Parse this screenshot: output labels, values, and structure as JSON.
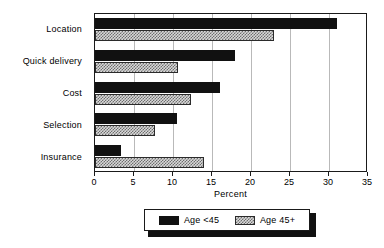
{
  "chart_data": {
    "type": "bar",
    "orientation": "horizontal",
    "title": "",
    "categories": [
      "Location",
      "Quick delivery",
      "Cost",
      "Selection",
      "Insurance"
    ],
    "series": [
      {
        "name": "Age <45",
        "color": "#111111",
        "pattern": "solid",
        "values": [
          31,
          18,
          16,
          10.5,
          3.3
        ]
      },
      {
        "name": "Age 45+",
        "color": "#d8d8d8",
        "pattern": "hatched",
        "values": [
          23,
          10.6,
          12.3,
          7.7,
          14
        ]
      }
    ],
    "xlabel": "Percent",
    "ylabel": "",
    "xlim": [
      0,
      35
    ],
    "xticks": [
      0,
      5,
      10,
      15,
      20,
      25,
      30,
      35
    ],
    "xtick_labels": [
      "0",
      "5",
      "10",
      "15",
      "20",
      "25",
      "30",
      "35"
    ],
    "grid": "vertical",
    "legend_position": "bottom-center",
    "legend_entries": [
      "Age <45",
      "Age 45+"
    ]
  }
}
